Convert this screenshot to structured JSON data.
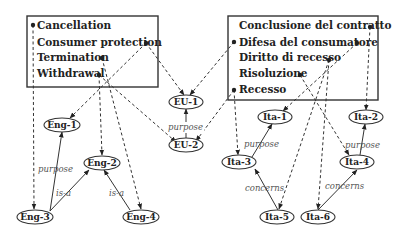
{
  "diagram": {
    "english_terms": [
      "Cancellation",
      "Consumer protection",
      "Termination",
      "Withdrawal"
    ],
    "italian_terms": [
      "Conclusione del contratto",
      "Difesa del consumatore",
      "Diritto di recesso",
      "Risoluzione",
      "Recesso"
    ],
    "nodes": {
      "eu1": "EU-1",
      "eu2": "EU-2",
      "eng1": "Eng-1",
      "eng2": "Eng-2",
      "eng3": "Eng-3",
      "eng4": "Eng-4",
      "ita1": "Ita-1",
      "ita2": "Ita-2",
      "ita3": "Ita-3",
      "ita4": "Ita-4",
      "ita5": "Ita-5",
      "ita6": "Ita-6"
    },
    "relations": {
      "eu_purpose": "purpose",
      "eng_purpose": "purpose",
      "eng_isa_1": "is-a",
      "eng_isa_2": "is-a",
      "ita_purpose_1": "purpose",
      "ita_purpose_2": "purpose",
      "ita_concerns_1": "concerns",
      "ita_concerns_2": "concerns"
    },
    "lexicalization_edges": [
      {
        "from": "Cancellation",
        "to": "Eng-3"
      },
      {
        "from": "Consumer protection",
        "to": "Eng-1"
      },
      {
        "from": "Consumer protection",
        "to": "EU-1"
      },
      {
        "from": "Termination",
        "to": "Eng-4"
      },
      {
        "from": "Withdrawal",
        "to": "Eng-2"
      },
      {
        "from": "Withdrawal",
        "to": "EU-2"
      },
      {
        "from": "Conclusione del contratto",
        "to": "Ita-2"
      },
      {
        "from": "Difesa del consumatore",
        "to": "EU-1"
      },
      {
        "from": "Difesa del consumatore",
        "to": "Ita-1"
      },
      {
        "from": "Diritto di recesso",
        "to": "Ita-5"
      },
      {
        "from": "Diritto di recesso",
        "to": "Ita-6"
      },
      {
        "from": "Risoluzione",
        "to": "Ita-4"
      },
      {
        "from": "Recesso",
        "to": "EU-2"
      },
      {
        "from": "Recesso",
        "to": "Ita-3"
      }
    ],
    "semantic_edges": [
      {
        "from": "Eng-3",
        "to": "Eng-1",
        "label": "purpose"
      },
      {
        "from": "Eng-3",
        "to": "Eng-2",
        "label": "is-a"
      },
      {
        "from": "Eng-4",
        "to": "Eng-2",
        "label": "is-a"
      },
      {
        "from": "EU-2",
        "to": "EU-1",
        "label": "purpose"
      },
      {
        "from": "Ita-3",
        "to": "Ita-1",
        "label": "purpose"
      },
      {
        "from": "Ita-4",
        "to": "Ita-2",
        "label": "purpose"
      },
      {
        "from": "Ita-5",
        "to": "Ita-3",
        "label": "concerns"
      },
      {
        "from": "Ita-6",
        "to": "Ita-4",
        "label": "concerns"
      }
    ]
  }
}
